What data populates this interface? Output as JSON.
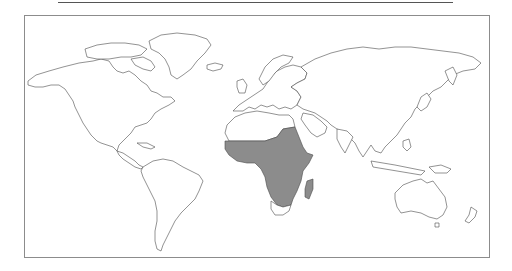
{
  "map": {
    "title": "World map with highlighted region",
    "projection": "equirectangular",
    "highlighted_region": "Sub-Saharan Africa and Madagascar",
    "colors": {
      "land": "#ffffff",
      "outline": "#4a4a4a",
      "highlight": "#8c8c8c",
      "frame": "#8c8c8c",
      "rule": "#555555"
    }
  }
}
